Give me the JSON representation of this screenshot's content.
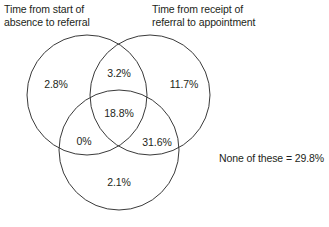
{
  "figure": {
    "type": "venn-3-set",
    "title": "",
    "background_color": "#ffffff",
    "stroke_color": "#3a3a3a",
    "text_color": "#231f20"
  },
  "headers": {
    "left": "Time from start of\nabsence to referral",
    "right": "Time from receipt of\nreferral to appointment",
    "bottom": ""
  },
  "regions": {
    "left_only": "2.8%",
    "left_right": "3.2%",
    "right_only": "11.7%",
    "all_three": "18.8%",
    "left_bottom": "0%",
    "right_bottom": "31.6%",
    "bottom_only": "2.1%"
  },
  "outside": {
    "note": "None of these = 29.8%"
  },
  "chart_data": {
    "type": "venn",
    "title": "",
    "sets": [
      {
        "id": "left",
        "label": "Time from start of absence to referral"
      },
      {
        "id": "right",
        "label": "Time from receipt of referral to appointment"
      },
      {
        "id": "bottom",
        "label": ""
      }
    ],
    "regions": [
      {
        "sets": [
          "left"
        ],
        "label": "2.8%",
        "value": 2.8
      },
      {
        "sets": [
          "left",
          "right"
        ],
        "label": "3.2%",
        "value": 3.2
      },
      {
        "sets": [
          "right"
        ],
        "label": "11.7%",
        "value": 11.7
      },
      {
        "sets": [
          "left",
          "right",
          "bottom"
        ],
        "label": "18.8%",
        "value": 18.8
      },
      {
        "sets": [
          "left",
          "bottom"
        ],
        "label": "0%",
        "value": 0.0
      },
      {
        "sets": [
          "right",
          "bottom"
        ],
        "label": "31.6%",
        "value": 31.6
      },
      {
        "sets": [
          "bottom"
        ],
        "label": "2.1%",
        "value": 2.1
      },
      {
        "sets": [],
        "label": "None of these = 29.8%",
        "value": 29.8
      }
    ],
    "units": "percent",
    "legend": "none",
    "grid": false
  },
  "geometry": {
    "left_circle": {
      "cx": 87,
      "cy": 95,
      "r": 60
    },
    "right_circle": {
      "cx": 150,
      "cy": 95,
      "r": 60
    },
    "bottom_circle": {
      "cx": 119,
      "cy": 150,
      "r": 60
    }
  }
}
